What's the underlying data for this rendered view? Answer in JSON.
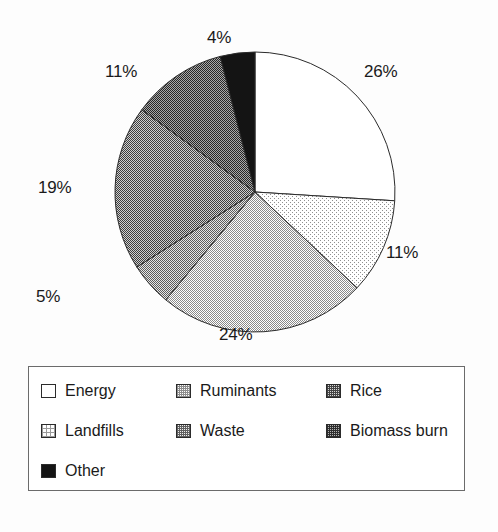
{
  "chart_data": {
    "type": "pie",
    "title": "",
    "subtitle": "",
    "xlabel": "",
    "ylabel": "",
    "legend_position": "bottom",
    "grid": false,
    "unit": "%",
    "categories": [
      "Energy",
      "Landfills",
      "Ruminants",
      "Waste",
      "Rice",
      "Biomass burn",
      "Other"
    ],
    "values": [
      26,
      11,
      24,
      5,
      19,
      11,
      4
    ],
    "slices": [
      {
        "label": "Energy",
        "value": 26,
        "value_text": "26%",
        "fill": "white",
        "fill_hex": "#ffffff",
        "start_deg": 0,
        "end_deg": 93.6
      },
      {
        "label": "Landfills",
        "value": 11,
        "value_text": "11%",
        "fill": "verylight",
        "fill_hex": "#f2f2f2",
        "start_deg": 93.6,
        "end_deg": 133.2
      },
      {
        "label": "Ruminants",
        "value": 24,
        "value_text": "24%",
        "fill": "light",
        "fill_hex": "#c8c8c8",
        "start_deg": 133.2,
        "end_deg": 219.6
      },
      {
        "label": "Waste",
        "value": 5,
        "value_text": "5%",
        "fill": "medium",
        "fill_hex": "#969696",
        "start_deg": 219.6,
        "end_deg": 237.6
      },
      {
        "label": "Rice",
        "value": 19,
        "value_text": "19%",
        "fill": "darkmed",
        "fill_hex": "#787878",
        "start_deg": 237.6,
        "end_deg": 306.0
      },
      {
        "label": "Biomass burn",
        "value": 11,
        "value_text": "11%",
        "fill": "dark",
        "fill_hex": "#555555",
        "start_deg": 306.0,
        "end_deg": 345.6
      },
      {
        "label": "Other",
        "value": 4,
        "value_text": "4%",
        "fill": "black",
        "fill_hex": "#141414",
        "start_deg": 345.6,
        "end_deg": 360.0
      }
    ],
    "labels": {
      "energy": "26%",
      "landfills": "11%",
      "ruminants": "24%",
      "waste": "5%",
      "rice": "19%",
      "biomass": "11%",
      "other": "4%"
    }
  },
  "legend": {
    "items": [
      {
        "label": "Energy",
        "fill": "white"
      },
      {
        "label": "Ruminants",
        "fill": "light"
      },
      {
        "label": "Rice",
        "fill": "darkmed"
      },
      {
        "label": "Landfills",
        "fill": "verylight"
      },
      {
        "label": "Waste",
        "fill": "medium"
      },
      {
        "label": "Biomass burn",
        "fill": "dark"
      },
      {
        "label": "Other",
        "fill": "black"
      }
    ]
  }
}
